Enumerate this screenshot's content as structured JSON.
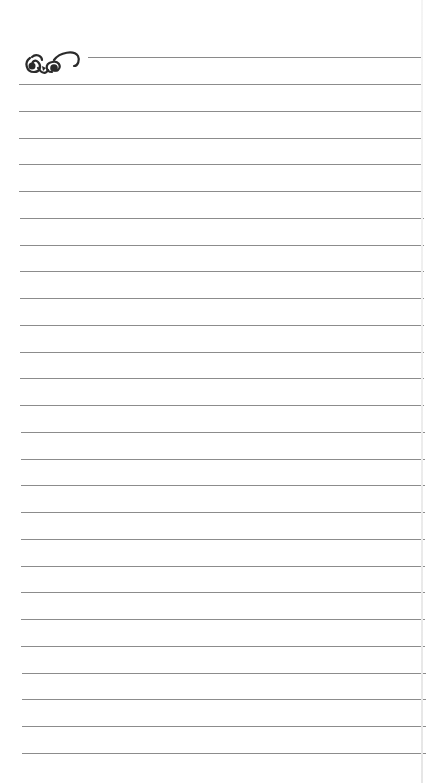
{
  "page": {
    "type": "lined notepad page",
    "ornament_icon": "flourish-scroll-icon",
    "line_color": "#8c8c8c",
    "background": "#ffffff",
    "header_line": {
      "top": 57,
      "left": 88
    },
    "rules": {
      "count": 26,
      "first_top": 84,
      "spacing": 26.76,
      "left": 19
    }
  }
}
